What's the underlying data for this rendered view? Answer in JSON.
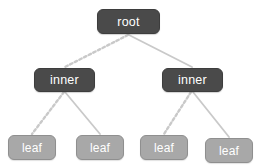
{
  "diagram": {
    "type": "binary-tree",
    "background_color": "#ffffff",
    "palette": {
      "internal_node_fill": "#4a4a4a",
      "internal_node_border": "#3d3d3d",
      "leaf_node_fill": "#a8a8a8",
      "leaf_node_border": "#8f8f8f",
      "node_text": "#ffffff",
      "edge_color": "#c9c9c9"
    },
    "nodes": [
      {
        "id": "root",
        "label": "root",
        "kind": "root",
        "x": 97,
        "y": 9,
        "w": 63,
        "h": 25
      },
      {
        "id": "inner1",
        "label": "inner",
        "kind": "internal",
        "x": 34,
        "y": 68,
        "w": 61,
        "h": 24
      },
      {
        "id": "inner2",
        "label": "inner",
        "kind": "internal",
        "x": 162,
        "y": 68,
        "w": 61,
        "h": 24
      },
      {
        "id": "leaf1",
        "label": "leaf",
        "kind": "leaf",
        "x": 8,
        "y": 135,
        "w": 48,
        "h": 25
      },
      {
        "id": "leaf2",
        "label": "leaf",
        "kind": "leaf",
        "x": 76,
        "y": 135,
        "w": 48,
        "h": 25
      },
      {
        "id": "leaf3",
        "label": "leaf",
        "kind": "leaf",
        "x": 140,
        "y": 135,
        "w": 48,
        "h": 25
      },
      {
        "id": "leaf4",
        "label": "leaf",
        "kind": "leaf",
        "x": 205,
        "y": 138,
        "w": 48,
        "h": 25
      }
    ],
    "edges": [
      {
        "from": "root",
        "to": "inner1",
        "side": "left",
        "style": "dotted",
        "x1": 128,
        "y1": 35,
        "x2": 65,
        "y2": 67
      },
      {
        "from": "root",
        "to": "inner2",
        "side": "right",
        "style": "solid",
        "x1": 129,
        "y1": 35,
        "x2": 192,
        "y2": 67
      },
      {
        "from": "inner1",
        "to": "leaf1",
        "side": "left",
        "style": "dotted",
        "x1": 64,
        "y1": 92,
        "x2": 32,
        "y2": 134
      },
      {
        "from": "inner1",
        "to": "leaf2",
        "side": "right",
        "style": "solid",
        "x1": 65,
        "y1": 92,
        "x2": 100,
        "y2": 134
      },
      {
        "from": "inner2",
        "to": "leaf3",
        "side": "left",
        "style": "dotted",
        "x1": 191,
        "y1": 92,
        "x2": 164,
        "y2": 134
      },
      {
        "from": "inner2",
        "to": "leaf4",
        "side": "right",
        "style": "solid",
        "x1": 193,
        "y1": 92,
        "x2": 229,
        "y2": 137
      }
    ]
  }
}
